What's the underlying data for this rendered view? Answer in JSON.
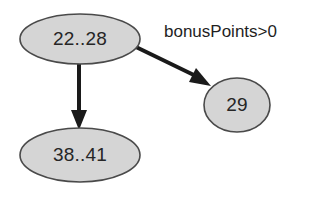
{
  "diagram": {
    "type": "state-transition-graph",
    "background_color": "#ffffff",
    "node_fill_color": "#d5d5d5",
    "node_border_color": "#4a4a4a",
    "edge_color": "#1a1a1a",
    "text_color": "#262626",
    "nodes": [
      {
        "id": "node-22-28",
        "label": "22..28",
        "shape": "ellipse",
        "cx": 80,
        "cy": 39,
        "rx": 60,
        "ry": 25
      },
      {
        "id": "node-38-41",
        "label": "38..41",
        "shape": "ellipse",
        "cx": 80,
        "cy": 155,
        "rx": 60,
        "ry": 27
      },
      {
        "id": "node-29",
        "label": "29",
        "shape": "circle",
        "cx": 237,
        "cy": 105,
        "rx": 33,
        "ry": 27
      }
    ],
    "edges": [
      {
        "id": "edge-22-28-to-38-41",
        "from": "node-22-28",
        "to": "node-38-41",
        "label": "",
        "x1": 79,
        "y1": 63,
        "x2": 79,
        "y2": 127
      },
      {
        "id": "edge-22-28-to-29",
        "from": "node-22-28",
        "to": "node-29",
        "label": "bonusPoints>0",
        "label_x": 164,
        "label_y": 33,
        "x1": 137,
        "y1": 48,
        "x2": 209,
        "y2": 85
      }
    ]
  }
}
